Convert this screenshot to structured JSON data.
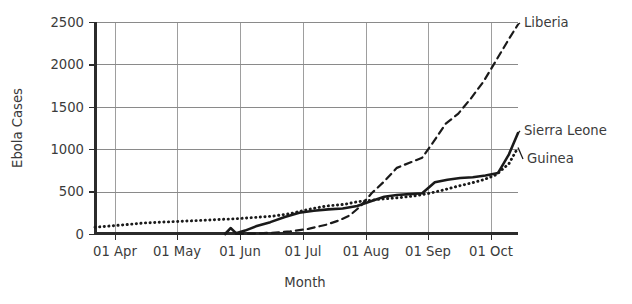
{
  "chart_data": {
    "type": "line",
    "title": "",
    "xlabel": "Month",
    "ylabel": "Ebola Cases",
    "ylim": [
      0,
      2500
    ],
    "yticks": [
      0,
      500,
      1000,
      1500,
      2000,
      2500
    ],
    "ytick_labels": [
      "0",
      "500",
      "1000",
      "1500",
      "2000",
      "2500"
    ],
    "xtick_labels": [
      "01 Apr",
      "01 May",
      "01 Jun",
      "01 Jul",
      "01 Aug",
      "01 Sep",
      "01 Oct"
    ],
    "xtick_positions": [
      115,
      177,
      240,
      303,
      366,
      428,
      491
    ],
    "xlim_days": [
      -17,
      217
    ],
    "grid": "both",
    "legend_position": "right-of-line-ends",
    "series": [
      {
        "name": "Guinea",
        "style": "dotted",
        "color": "#1a1a1a",
        "label_x": 527,
        "label_y": 163,
        "x_days": [
          -17,
          0,
          10,
          20,
          31,
          41,
          51,
          61,
          71,
          81,
          91,
          101,
          111,
          121,
          128,
          136,
          143,
          152,
          160,
          168,
          176,
          183,
          191,
          198,
          205,
          212,
          217
        ],
        "values": [
          80,
          110,
          130,
          140,
          150,
          160,
          170,
          180,
          195,
          210,
          240,
          290,
          330,
          350,
          380,
          400,
          415,
          430,
          450,
          480,
          520,
          560,
          600,
          640,
          700,
          830,
          1020
        ]
      },
      {
        "name": "Liberia",
        "style": "dashed",
        "color": "#1a1a1a",
        "label_x": 524,
        "label_y": 27,
        "x_days": [
          61,
          71,
          81,
          91,
          101,
          111,
          118,
          124,
          130,
          136,
          143,
          150,
          157,
          164,
          170,
          177,
          184,
          191,
          198,
          205,
          212,
          217
        ],
        "values": [
          0,
          5,
          15,
          30,
          60,
          110,
          160,
          220,
          330,
          480,
          620,
          780,
          840,
          900,
          1080,
          1300,
          1420,
          1600,
          1800,
          2050,
          2300,
          2470
        ]
      },
      {
        "name": "Sierra Leone",
        "style": "solid",
        "color": "#1a1a1a",
        "label_x": 524,
        "label_y": 135,
        "x_days": [
          55,
          58,
          61,
          66,
          72,
          80,
          88,
          96,
          104,
          112,
          120,
          128,
          136,
          143,
          150,
          157,
          164,
          171,
          178,
          185,
          192,
          199,
          206,
          212,
          217
        ],
        "values": [
          0,
          70,
          10,
          40,
          90,
          140,
          200,
          250,
          275,
          290,
          300,
          330,
          390,
          440,
          460,
          470,
          480,
          610,
          640,
          660,
          670,
          690,
          720,
          940,
          1190
        ]
      }
    ]
  },
  "axes": {
    "y_axis_label": "Ebola Cases",
    "x_axis_label": "Month"
  }
}
